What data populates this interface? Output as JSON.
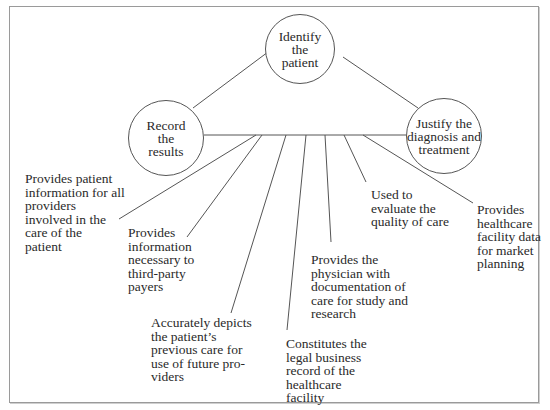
{
  "diagram": {
    "nodes": {
      "identify": {
        "label": "Identify\nthe\npatient"
      },
      "record": {
        "label": "Record\nthe\nresults"
      },
      "justify": {
        "label": "Justify the\ndiagnosis and\ntreatment"
      }
    },
    "purposes": [
      {
        "label": "Provides patient\ninformation for all\nproviders\ninvolved in the\ncare of the\npatient"
      },
      {
        "label": "Provides\ninformation\nnecessary to\nthird-party\npayers"
      },
      {
        "label": "Accurately depicts\nthe patient’s\nprevious care for\nuse of future pro-\nviders"
      },
      {
        "label": "Constitutes the\nlegal business\nrecord of the\nhealthcare\nfacility"
      },
      {
        "label": "Provides the\nphysician with\ndocumentation of\ncare for study and\nresearch"
      },
      {
        "label": "Used to\nevaluate the\nquality of care"
      },
      {
        "label": "Provides\nhealthcare\nfacility data\nfor market\nplanning"
      }
    ],
    "colors": {
      "line": "#555555",
      "frame": "#9a9a9a",
      "text": "#2a2a2a"
    }
  }
}
